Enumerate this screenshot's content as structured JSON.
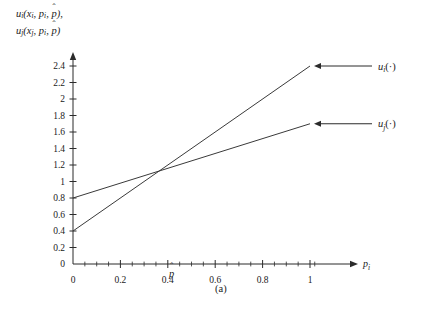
{
  "figure": {
    "caption": "(a)",
    "y_axis_label_line1": "u_i(x_i, p_i, p̂),",
    "y_axis_label_line2": "u_j(x_j, p_i, p̂)",
    "x_axis_label": "p_i",
    "phat_marker": "p̂"
  },
  "chart_data": {
    "type": "line",
    "title": "",
    "xlabel": "p_i",
    "ylabel": "u_i(x_i, p_i, p̂), u_j(x_j, p_i, p̂)",
    "xlim": [
      0,
      1.06
    ],
    "ylim": [
      0,
      2.5
    ],
    "grid": false,
    "legend": "right-inline-arrow-annotations",
    "xticks": [
      0,
      0.2,
      0.4,
      0.6,
      0.8,
      1
    ],
    "xticklabels": [
      "0",
      "0.2",
      "0.4",
      "0.6",
      "0.8",
      "1"
    ],
    "xminorticks": [
      0.05,
      0.1,
      0.15,
      0.25,
      0.3,
      0.35,
      0.45,
      0.5,
      0.55,
      0.65,
      0.7,
      0.75,
      0.85,
      0.9,
      0.95,
      1.02
    ],
    "yticks": [
      0,
      0.2,
      0.4,
      0.6,
      0.8,
      1,
      1.2,
      1.4,
      1.6,
      1.8,
      2,
      2.2,
      2.4
    ],
    "yticklabels": [
      "0",
      "0.2",
      "0.4",
      "0.6",
      "0.8",
      "1",
      "1.2",
      "1.4",
      "1.6",
      "1.8",
      "2",
      "2.2",
      "2.4"
    ],
    "annotations": [
      {
        "text": "p̂",
        "x": 0.4,
        "y": 0,
        "note": "marker below x tick 0.4"
      },
      {
        "text": "(a)",
        "x": 0.58,
        "y": -0.3,
        "note": "figure caption"
      }
    ],
    "series": [
      {
        "name": "u_i(·)",
        "label": "u_i(·)",
        "x": [
          0,
          1
        ],
        "values": [
          0.4,
          2.4
        ],
        "slope": 2.0,
        "intercept": 0.4,
        "color": "#3a3a3a"
      },
      {
        "name": "u_j(·)",
        "label": "u_j(·)",
        "x": [
          0,
          1
        ],
        "values": [
          0.8,
          1.7
        ],
        "slope": 0.9,
        "intercept": 0.8,
        "color": "#3a3a3a"
      }
    ],
    "intersection": {
      "x": 0.4,
      "y": 1.2
    }
  }
}
